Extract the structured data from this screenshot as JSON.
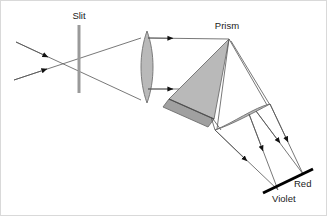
{
  "figure": {
    "title_present": false,
    "background_color": "#ffffff",
    "border_color": "#d9d9d9",
    "width": 327,
    "height": 216
  },
  "labels": {
    "slit": "Slit",
    "prism": "Prism",
    "red": "Red",
    "violet": "Violet"
  },
  "colors": {
    "ray": "#555555",
    "arrow": "#111111",
    "glass_fill": "#b9b9b9",
    "glass_fill_dark": "#a0a0a0",
    "glass_stroke": "#6e6e6e",
    "slit_color": "#9a9a9a",
    "screen_color": "#000000",
    "text": "#1a1a1a"
  },
  "components": {
    "slit": {
      "name": "Slit",
      "x": 78,
      "y_top": 24,
      "y_bottom": 92,
      "thickness": 3
    },
    "collimating_lens": {
      "name": "Collimating lens",
      "center_x": 146,
      "y_top": 30,
      "y_bottom": 102,
      "half_width": 7
    },
    "prism": {
      "name": "Prism",
      "apex": [
        228,
        38
      ],
      "base_left": [
        168,
        98
      ],
      "base_right": [
        213,
        118
      ]
    },
    "focusing_lens": {
      "name": "Focusing lens",
      "end_a": [
        214,
        129
      ],
      "end_b": [
        269,
        103
      ],
      "bulge": 9
    },
    "screen": {
      "name": "Screen",
      "end_left": [
        262,
        192
      ],
      "end_right": [
        312,
        168
      ],
      "thickness": 3,
      "red_end": "Red",
      "violet_end": "Violet"
    }
  },
  "rays": {
    "source_rays_count": 2,
    "collimated_rays_count": 2,
    "dispersed_bundles": 2,
    "arrowheads_count": 8
  }
}
